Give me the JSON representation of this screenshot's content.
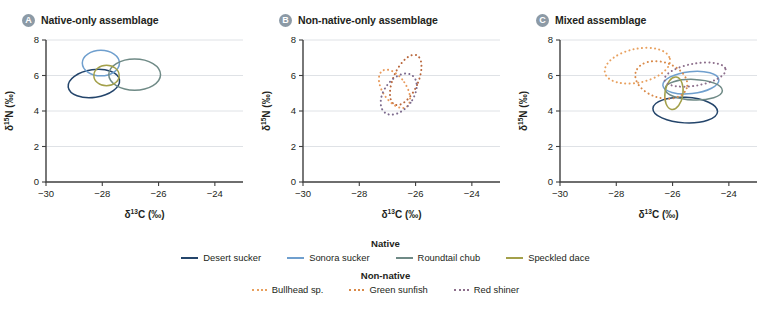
{
  "chart_data": {
    "type": "scatter",
    "xlabel": "d13C",
    "ylabel": "d15N",
    "xlim": [
      -30,
      -23
    ],
    "ylim": [
      0,
      8
    ],
    "xticks": [
      -30,
      -28,
      -26,
      -24
    ],
    "yticks": [
      0,
      2,
      4,
      6,
      8
    ],
    "xtick_labels": [
      "−30",
      "−28",
      "−26",
      "−24"
    ],
    "ytick_labels": [
      "0",
      "2",
      "4",
      "6",
      "8"
    ],
    "grid": "horizontal",
    "legend_position": "bottom",
    "panels": [
      {
        "id": "A",
        "title": "Native-only assemblage",
        "ellipses": [
          {
            "species": "Desert sucker",
            "cx": -28.3,
            "cy": 5.55,
            "rx": 0.92,
            "ry": 0.78,
            "angle": -8,
            "color": "#24456b",
            "style": "solid"
          },
          {
            "species": "Sonora sucker",
            "cx": -28.05,
            "cy": 6.7,
            "rx": 0.66,
            "ry": 0.72,
            "angle": 0,
            "color": "#6f9fce",
            "style": "solid"
          },
          {
            "species": "Roundtail chub",
            "cx": -26.85,
            "cy": 6.05,
            "rx": 0.92,
            "ry": 0.88,
            "angle": 0,
            "color": "#6f8a86",
            "style": "solid"
          },
          {
            "species": "Speckled dace",
            "cx": -27.85,
            "cy": 6.0,
            "rx": 0.45,
            "ry": 0.58,
            "angle": 0,
            "color": "#a3a04a",
            "style": "solid"
          }
        ]
      },
      {
        "id": "B",
        "title": "Non-native-only assemblage",
        "ellipses": [
          {
            "species": "Bullhead sp.",
            "cx": -26.35,
            "cy": 5.75,
            "rx": 0.44,
            "ry": 1.52,
            "angle": 24,
            "color": "#b9673c",
            "style": "dotted"
          },
          {
            "species": "Green sunfish",
            "cx": -26.75,
            "cy": 5.25,
            "rx": 0.42,
            "ry": 1.22,
            "angle": -34,
            "color": "#e89a5c",
            "style": "dotted"
          },
          {
            "species": "Red shiner",
            "cx": -26.6,
            "cy": 4.95,
            "rx": 0.52,
            "ry": 1.3,
            "angle": 36,
            "color": "#7d6b8e",
            "style": "dotted"
          }
        ]
      },
      {
        "id": "C",
        "title": "Mixed assemblage",
        "ellipses": [
          {
            "species": "Desert sucker",
            "cx": -25.55,
            "cy": 4.05,
            "rx": 1.15,
            "ry": 0.72,
            "angle": 3,
            "color": "#24456b",
            "style": "solid"
          },
          {
            "species": "Sonora sucker",
            "cx": -25.35,
            "cy": 5.6,
            "rx": 1.0,
            "ry": 0.62,
            "angle": -6,
            "color": "#6f9fce",
            "style": "solid"
          },
          {
            "species": "Roundtail chub",
            "cx": -25.25,
            "cy": 5.2,
            "rx": 1.02,
            "ry": 0.58,
            "angle": 2,
            "color": "#6f8a86",
            "style": "solid"
          },
          {
            "species": "Speckled dace",
            "cx": -25.95,
            "cy": 5.0,
            "rx": 0.32,
            "ry": 0.92,
            "angle": 8,
            "color": "#a3a04a",
            "style": "solid"
          },
          {
            "species": "Bullhead sp.",
            "cx": -27.25,
            "cy": 6.55,
            "rx": 1.18,
            "ry": 0.95,
            "angle": -12,
            "color": "#e8a05e",
            "style": "dotted"
          },
          {
            "species": "Green sunfish",
            "cx": -26.4,
            "cy": 5.75,
            "rx": 0.95,
            "ry": 1.0,
            "angle": 18,
            "color": "#d98a4a",
            "style": "dotted"
          },
          {
            "species": "Red shiner",
            "cx": -25.2,
            "cy": 6.05,
            "rx": 1.1,
            "ry": 0.62,
            "angle": -10,
            "color": "#8d6f8c",
            "style": "dotted"
          }
        ]
      }
    ],
    "legend": {
      "groups": [
        {
          "title": "Native",
          "style": "solid",
          "entries": [
            {
              "label": "Desert sucker",
              "color": "#24456b"
            },
            {
              "label": "Sonora sucker",
              "color": "#6f9fce"
            },
            {
              "label": "Roundtail chub",
              "color": "#6f8a86"
            },
            {
              "label": "Speckled dace",
              "color": "#a3a04a"
            }
          ]
        },
        {
          "title": "Non-native",
          "style": "dotted",
          "entries": [
            {
              "label": "Bullhead sp.",
              "color": "#e8a05e"
            },
            {
              "label": "Green sunfish",
              "color": "#d98a4a"
            },
            {
              "label": "Red shiner",
              "color": "#8d6f8c"
            }
          ]
        }
      ]
    }
  }
}
